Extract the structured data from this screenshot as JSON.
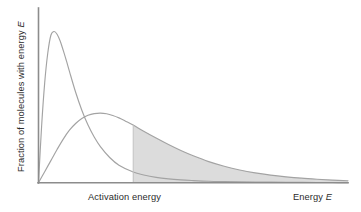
{
  "figure": {
    "background": "#ffffff",
    "width": 361,
    "height": 212,
    "axis_color": "#8c8c8c",
    "curve_color": "#a3a3a3",
    "fill_color_light": "#dcdcdc",
    "fill_color_dark": "#c9c9c9",
    "text_color": "#2b2b2b"
  },
  "labels": {
    "y_axis_prefix": "Fraction of molecules with energy ",
    "y_axis_symbol": "E",
    "x_activation": "Activation energy",
    "x_energy_prefix": "Energy ",
    "x_energy_symbol": "E"
  },
  "chart_data": {
    "type": "line",
    "title": "",
    "xlabel": "Energy E",
    "ylabel": "Fraction of molecules with energy E",
    "xlim": [
      0,
      100
    ],
    "ylim": [
      0,
      100
    ],
    "grid": false,
    "legend": "none",
    "axis_ticks": "none",
    "annotations": [
      {
        "name": "activation-energy-line",
        "kind": "vertical-line",
        "x": 30.6,
        "label": "Activation energy"
      },
      {
        "name": "shaded-area-low-temperature",
        "kind": "area-fill",
        "series": "low temperature",
        "x_from": 30.6,
        "x_to": 100,
        "color": "#c9c9c9"
      },
      {
        "name": "shaded-area-high-temperature",
        "kind": "area-fill",
        "series": "high temperature",
        "x_from": 30.6,
        "x_to": 100,
        "color": "#dcdcdc"
      }
    ],
    "series": [
      {
        "name": "low temperature",
        "description": "tall narrow Maxwell-Boltzmann distribution",
        "peak_x": 4.2,
        "peak_y": 88.6,
        "x": [
          0,
          1,
          2,
          3,
          4,
          5,
          6,
          7,
          8,
          9,
          10,
          12,
          14,
          16,
          18,
          20,
          23,
          26,
          30.6,
          34,
          38,
          42,
          46,
          50,
          55,
          60,
          65,
          70,
          75,
          80,
          85,
          90,
          95,
          100
        ],
        "y": [
          0,
          33.0,
          58.5,
          76.0,
          86.4,
          88.6,
          87.0,
          83.0,
          77.5,
          71.5,
          65.2,
          53.0,
          42.5,
          33.8,
          26.8,
          21.2,
          14.8,
          10.3,
          6.3,
          4.6,
          3.2,
          2.3,
          1.7,
          1.3,
          0.9,
          0.7,
          0.55,
          0.45,
          0.38,
          0.3,
          0.25,
          0.2,
          0.15,
          0.1
        ]
      },
      {
        "name": "high temperature",
        "description": "broad flat Maxwell-Boltzmann distribution",
        "peak_x": 20.0,
        "peak_y": 40.8,
        "x": [
          0,
          2,
          4,
          6,
          8,
          10,
          12,
          14,
          16,
          18,
          20,
          22,
          24,
          26,
          28,
          30.6,
          34,
          38,
          42,
          46,
          50,
          55,
          60,
          65,
          70,
          75,
          80,
          85,
          90,
          95,
          100
        ],
        "y": [
          0,
          6.5,
          13.0,
          19.5,
          25.6,
          30.8,
          34.7,
          37.6,
          39.5,
          40.5,
          40.8,
          40.4,
          39.4,
          38.0,
          36.2,
          33.8,
          30.2,
          26.2,
          22.4,
          18.9,
          15.8,
          12.4,
          9.7,
          7.5,
          5.8,
          4.5,
          3.5,
          2.7,
          2.1,
          1.6,
          1.2
        ]
      }
    ]
  }
}
